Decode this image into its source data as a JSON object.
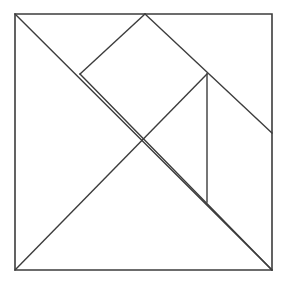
{
  "figure": {
    "type": "line-diagram",
    "background_color": "#ffffff",
    "canvas": {
      "width": 286,
      "height": 283
    },
    "stroke_color": "#3c3c3c",
    "outline_stroke_width": 1.6,
    "inner_stroke_width": 1.4
  },
  "geometry": {
    "square": {
      "name": "outer-square",
      "left": 15,
      "top": 14,
      "right": 272,
      "bottom": 270,
      "side": 257,
      "points": "15,14 272,14 272,270 15,270"
    },
    "vertices": {
      "top_left": {
        "x": 15,
        "y": 14
      },
      "top_mid": {
        "x": 145,
        "y": 14
      },
      "top_right": {
        "x": 272,
        "y": 14
      },
      "bottom_left": {
        "x": 15,
        "y": 270
      },
      "bottom_right": {
        "x": 272,
        "y": 270
      },
      "left_upper_node": {
        "x": 80,
        "y": 74
      },
      "right_upper_node": {
        "x": 207,
        "y": 74
      },
      "center_cross": {
        "x": 145,
        "y": 145
      },
      "right_edge_node": {
        "x": 272,
        "y": 133
      },
      "vertical_bottom_node": {
        "x": 207,
        "y": 202
      }
    },
    "segments": [
      {
        "name": "main-diagonal",
        "description": "top-left corner to bottom-right corner",
        "from": {
          "x": 15,
          "y": 14
        },
        "to": {
          "x": 272,
          "y": 270
        }
      },
      {
        "name": "apex-left-edge",
        "description": "top midpoint down-left to left upper node",
        "from": {
          "x": 145,
          "y": 14
        },
        "to": {
          "x": 80,
          "y": 74
        }
      },
      {
        "name": "apex-right-edge",
        "description": "top midpoint down-right through right upper node to right edge",
        "from": {
          "x": 145,
          "y": 14
        },
        "to": {
          "x": 272,
          "y": 133
        }
      },
      {
        "name": "left-node-to-bottom-right",
        "description": "left upper node down-right through center to bottom-right corner",
        "from": {
          "x": 80,
          "y": 74
        },
        "to": {
          "x": 272,
          "y": 270
        }
      },
      {
        "name": "bottom-left-rising-diagonal",
        "description": "bottom-left corner up-right through center to right upper node",
        "from": {
          "x": 15,
          "y": 270
        },
        "to": {
          "x": 207,
          "y": 74
        }
      },
      {
        "name": "vertical-divider",
        "description": "vertical line from right upper node down to the lower diagonal",
        "from": {
          "x": 207,
          "y": 74
        },
        "to": {
          "x": 207,
          "y": 202
        }
      }
    ]
  },
  "labels": {
    "caption": ""
  }
}
